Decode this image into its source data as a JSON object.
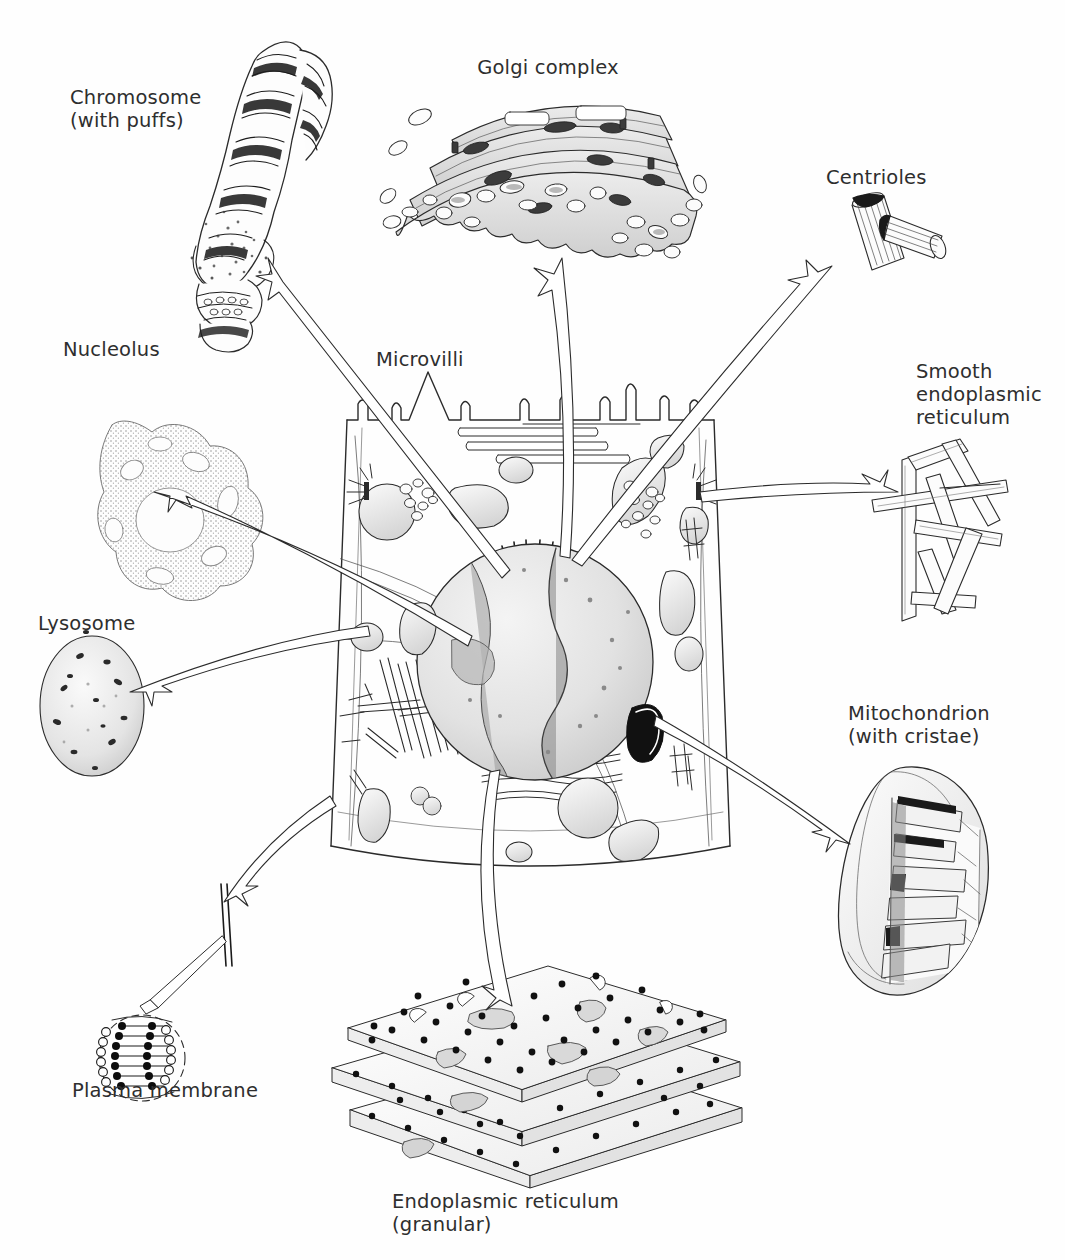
{
  "diagram": {
    "background_color": "#fefefe",
    "ink_color": "#2b2b2b",
    "label_color": "#2e2e2e"
  },
  "labels": {
    "chromosome": "Chromosome\n(with puffs)",
    "golgi": "Golgi complex",
    "centrioles": "Centrioles",
    "nucleolus": "Nucleolus",
    "microvilli": "Microvilli",
    "smooth_er": "Smooth\nendoplasmic\nreticulum",
    "lysosome": "Lysosome",
    "mitochondrion": "Mitochondrion\n(with cristae)",
    "plasma_membrane": "Plasma membrane",
    "rough_er": "Endoplasmic reticulum\n(granular)"
  },
  "organelles": [
    {
      "key": "chromosome",
      "name": "Chromosome (with puffs)",
      "position": "top-left",
      "has_leader_arrow": true
    },
    {
      "key": "golgi",
      "name": "Golgi complex",
      "position": "top-center",
      "has_leader_arrow": true
    },
    {
      "key": "centrioles",
      "name": "Centrioles",
      "position": "top-right",
      "has_leader_arrow": true
    },
    {
      "key": "nucleolus",
      "name": "Nucleolus",
      "position": "left-upper",
      "has_leader_arrow": true
    },
    {
      "key": "microvilli",
      "name": "Microvilli",
      "position": "center-top",
      "has_leader_arrow": false
    },
    {
      "key": "smooth_er",
      "name": "Smooth endoplasmic reticulum",
      "position": "right-upper",
      "has_leader_arrow": true
    },
    {
      "key": "lysosome",
      "name": "Lysosome",
      "position": "left-middle",
      "has_leader_arrow": true
    },
    {
      "key": "mitochondrion",
      "name": "Mitochondrion (with cristae)",
      "position": "right-lower",
      "has_leader_arrow": true
    },
    {
      "key": "plasma_membrane",
      "name": "Plasma membrane",
      "position": "bottom-left",
      "has_leader_arrow": true
    },
    {
      "key": "rough_er",
      "name": "Endoplasmic reticulum (granular)",
      "position": "bottom-center",
      "has_leader_arrow": true
    }
  ]
}
